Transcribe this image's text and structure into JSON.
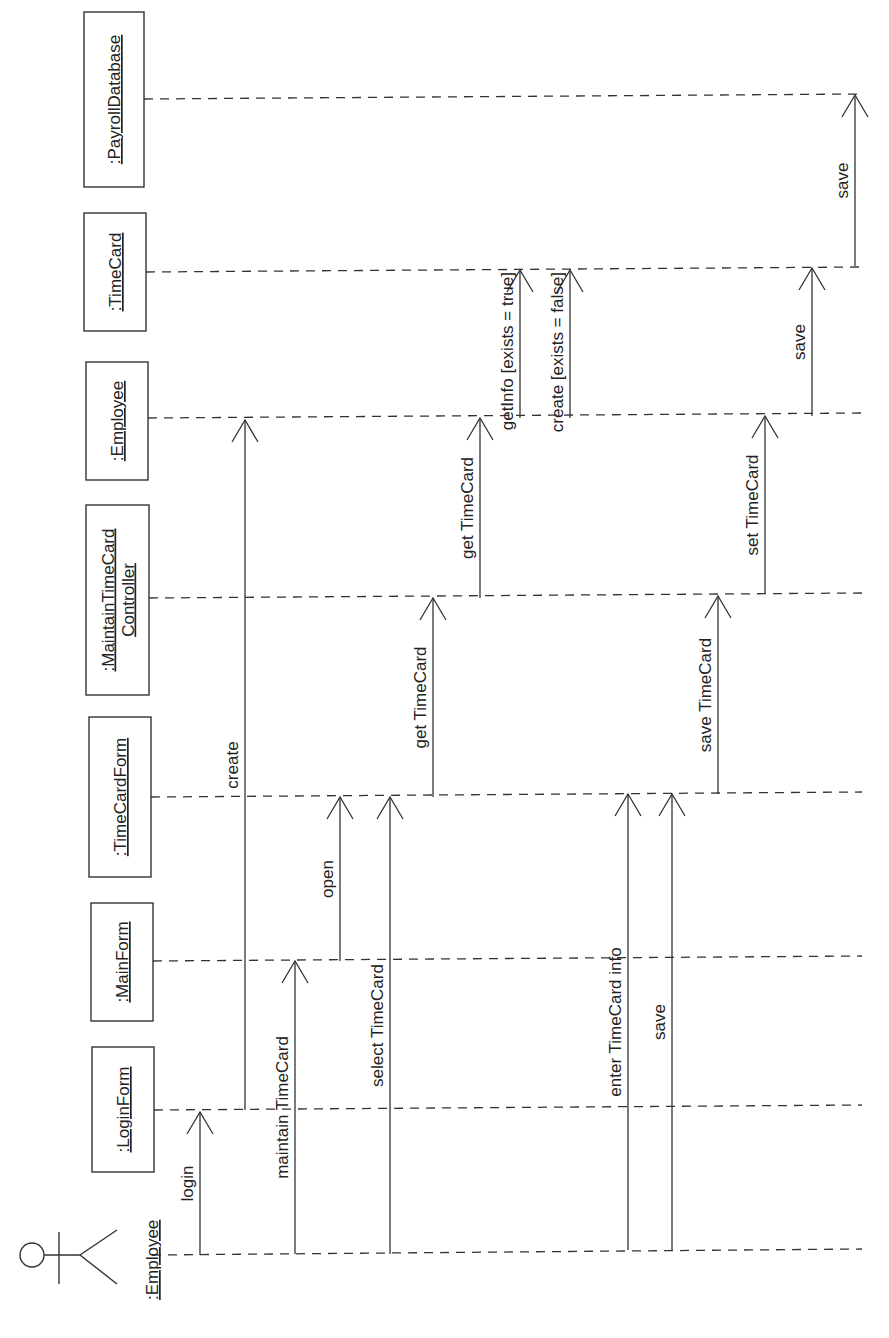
{
  "diagram": {
    "type": "UML sequence diagram",
    "orientation": "rotated 90deg counter-clockwise",
    "colors": {
      "ink": "#333333",
      "background": "#ffffff"
    },
    "lifeline_end_x": 862,
    "actor": {
      "name": ":Employee",
      "y": 1255,
      "icon": "stick-figure-icon"
    },
    "objects": [
      {
        "id": "payroll",
        "name": ":PayrollDatabase",
        "y": 99,
        "box": {
          "x": 84,
          "y": 12,
          "w": 60,
          "h": 175
        }
      },
      {
        "id": "timecard",
        "name": ":TimeCard",
        "y": 272,
        "box": {
          "x": 84,
          "y": 213,
          "w": 62,
          "h": 118
        }
      },
      {
        "id": "employee",
        "name": ":Employee",
        "y": 418,
        "box": {
          "x": 86,
          "y": 362,
          "w": 62,
          "h": 118
        }
      },
      {
        "id": "controller",
        "name": ":MaintainTimeCard",
        "name2": "Controller",
        "y": 598,
        "box": {
          "x": 86,
          "y": 505,
          "w": 63,
          "h": 190
        }
      },
      {
        "id": "tcform",
        "name": ":TimeCardForm",
        "y": 797,
        "box": {
          "x": 89,
          "y": 717,
          "w": 62,
          "h": 160
        }
      },
      {
        "id": "mainform",
        "name": ":MainForm",
        "y": 961,
        "box": {
          "x": 91,
          "y": 903,
          "w": 62,
          "h": 118
        }
      },
      {
        "id": "loginform",
        "name": ":LoginForm",
        "y": 1110,
        "box": {
          "x": 92,
          "y": 1047,
          "w": 62,
          "h": 125
        }
      }
    ],
    "messages": [
      {
        "label": "login",
        "x": 200,
        "from_y": 1255,
        "to_y": 1112
      },
      {
        "label": "create",
        "x": 245,
        "from_y": 1110,
        "to_y": 420
      },
      {
        "label": "maintain TimeCard",
        "x": 295,
        "from_y": 1254,
        "to_y": 961
      },
      {
        "label": "open",
        "x": 340,
        "from_y": 961,
        "to_y": 797
      },
      {
        "label": "select TimeCard",
        "x": 390,
        "from_y": 1254,
        "to_y": 797
      },
      {
        "label": "get TimeCard",
        "x": 433,
        "from_y": 797,
        "to_y": 598
      },
      {
        "label": "get TimeCard",
        "x": 480,
        "from_y": 598,
        "to_y": 418
      },
      {
        "label": "getInfo [exists = true]",
        "x": 520,
        "from_y": 418,
        "to_y": 270
      },
      {
        "label": "create [exists = false]",
        "x": 570,
        "from_y": 418,
        "to_y": 270
      },
      {
        "label": "enter TimeCard info",
        "x": 628,
        "from_y": 1250,
        "to_y": 794
      },
      {
        "label": "save",
        "x": 672,
        "from_y": 1250,
        "to_y": 794
      },
      {
        "label": "save TimeCard",
        "x": 718,
        "from_y": 794,
        "to_y": 596
      },
      {
        "label": "set TimeCard",
        "x": 765,
        "from_y": 594,
        "to_y": 416
      },
      {
        "label": "save",
        "x": 812,
        "from_y": 416,
        "to_y": 268
      },
      {
        "label": "save",
        "x": 855,
        "from_y": 266,
        "to_y": 95
      }
    ]
  }
}
